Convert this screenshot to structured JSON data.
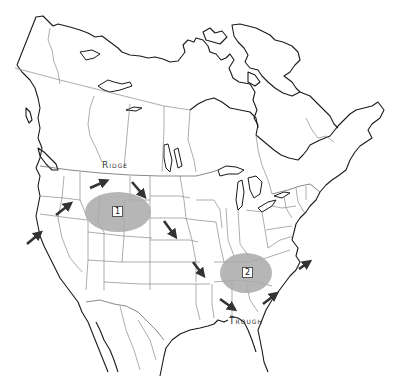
{
  "map": {
    "region": "North America (Canada, United States, northern Mexico)",
    "labels": {
      "ridge": "Ridge",
      "trough": "Trough"
    },
    "zones": [
      {
        "id": "1",
        "label": "1",
        "color": "#a9a9a9",
        "cx": 118,
        "cy": 212,
        "rx": 33,
        "ry": 20
      },
      {
        "id": "2",
        "label": "2",
        "color": "#a9a9a9",
        "cx": 246,
        "cy": 273,
        "rx": 26,
        "ry": 20
      }
    ],
    "arrows": [
      {
        "name": "arrow-pacific-coast",
        "x1": 27,
        "y1": 244,
        "x2": 42,
        "y2": 232
      },
      {
        "name": "arrow-pacific-nw",
        "x1": 56,
        "y1": 215,
        "x2": 72,
        "y2": 203
      },
      {
        "name": "arrow-ridge-west",
        "x1": 90,
        "y1": 188,
        "x2": 108,
        "y2": 180
      },
      {
        "name": "arrow-ridge-east",
        "x1": 132,
        "y1": 182,
        "x2": 146,
        "y2": 198
      },
      {
        "name": "arrow-plains-north",
        "x1": 164,
        "y1": 221,
        "x2": 176,
        "y2": 238
      },
      {
        "name": "arrow-plains-south",
        "x1": 193,
        "y1": 262,
        "x2": 204,
        "y2": 276
      },
      {
        "name": "arrow-gulf",
        "x1": 220,
        "y1": 299,
        "x2": 235,
        "y2": 310
      },
      {
        "name": "arrow-southeast",
        "x1": 263,
        "y1": 304,
        "x2": 278,
        "y2": 293
      },
      {
        "name": "arrow-atlantic",
        "x1": 299,
        "y1": 269,
        "x2": 310,
        "y2": 261
      }
    ],
    "colors": {
      "coastline": "#1a1a1a",
      "border": "#8a8a8a",
      "zone_fill": "#a9a9a9",
      "arrow": "#333333"
    }
  }
}
